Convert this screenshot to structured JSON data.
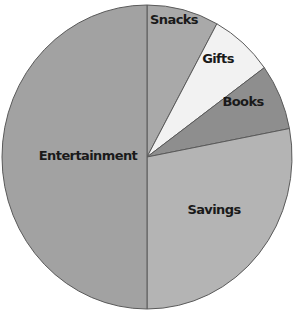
{
  "chart_data": {
    "type": "pie",
    "title": "",
    "start_angle_deg": 0,
    "direction": "clockwise",
    "categories": [
      "Snacks",
      "Gifts",
      "Books",
      "Savings",
      "Entertainment"
    ],
    "values": [
      8,
      7,
      7,
      28,
      50
    ],
    "unit": "percent (estimated)",
    "colors": [
      "#a9a9a9",
      "#f2f2f2",
      "#8e8e8e",
      "#b4b4b4",
      "#a2a2a2"
    ],
    "legend": "none (labels placed inside slices)",
    "stroke_color": "#5a5a5a"
  },
  "labels": {
    "snacks": "Snacks",
    "gifts": "Gifts",
    "books": "Books",
    "savings": "Savings",
    "entertainment": "Entertainment"
  }
}
